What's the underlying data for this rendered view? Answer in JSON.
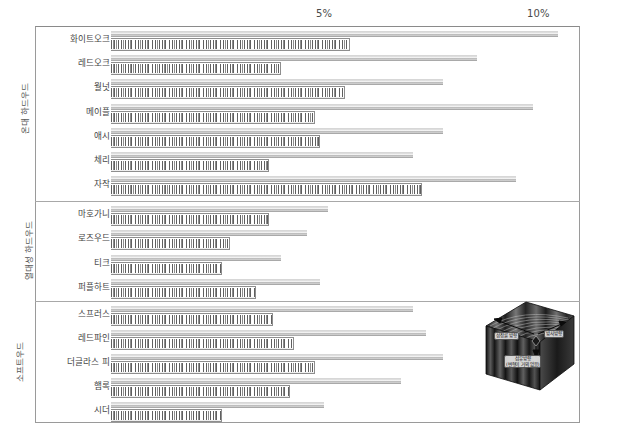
{
  "chart_data": {
    "type": "bar",
    "orientation": "horizontal",
    "title": "",
    "xlabel": "",
    "ylabel": "",
    "xlim": [
      0,
      11
    ],
    "grid": true,
    "tick_labels": [
      "5%",
      "10%"
    ],
    "tick_values": [
      5,
      10
    ],
    "legend_position": "none",
    "series": [
      {
        "name": "tangential",
        "style": "thin-light-bar"
      },
      {
        "name": "radial",
        "style": "thick-hatched-bar"
      }
    ],
    "groups": [
      {
        "name": "온대 하드우드",
        "rows": [
          {
            "label": "화이트오크",
            "tangential": 10.5,
            "radial": 5.6
          },
          {
            "label": "레드오크",
            "tangential": 8.6,
            "radial": 4.0
          },
          {
            "label": "월넛",
            "tangential": 7.8,
            "radial": 5.5
          },
          {
            "label": "메이플",
            "tangential": 9.9,
            "radial": 4.8
          },
          {
            "label": "애시",
            "tangential": 7.8,
            "radial": 4.9
          },
          {
            "label": "체리",
            "tangential": 7.1,
            "radial": 3.7
          },
          {
            "label": "자작",
            "tangential": 9.5,
            "radial": 7.3
          }
        ]
      },
      {
        "name": "열대성 하드우드",
        "rows": [
          {
            "label": "마호가니",
            "tangential": 5.1,
            "radial": 3.7
          },
          {
            "label": "로즈우드",
            "tangential": 4.6,
            "radial": 2.8
          },
          {
            "label": "티크",
            "tangential": 4.0,
            "radial": 2.6
          },
          {
            "label": "퍼플하트",
            "tangential": 4.9,
            "radial": 3.4
          }
        ]
      },
      {
        "name": "소프트우드",
        "rows": [
          {
            "label": "스프러스",
            "tangential": 7.1,
            "radial": 3.8
          },
          {
            "label": "레드파인",
            "tangential": 7.4,
            "radial": 4.3
          },
          {
            "label": "더글라스 피",
            "tangential": 7.8,
            "radial": 4.8
          },
          {
            "label": "햄록",
            "tangential": 6.8,
            "radial": 4.2
          },
          {
            "label": "시더",
            "tangential": 5.0,
            "radial": 2.6
          }
        ]
      }
    ]
  },
  "axis": {
    "ticks": [
      {
        "label": "5%",
        "value": 5
      },
      {
        "label": "10%",
        "value": 10
      }
    ]
  },
  "diagram": {
    "name": "wood-block-diagram",
    "labels": {
      "growth_ring": "성장륜 방향",
      "radial": "방사방향",
      "fiber_line1": "섬유방향",
      "fiber_line2": "(변형이 거의 없음)"
    }
  }
}
